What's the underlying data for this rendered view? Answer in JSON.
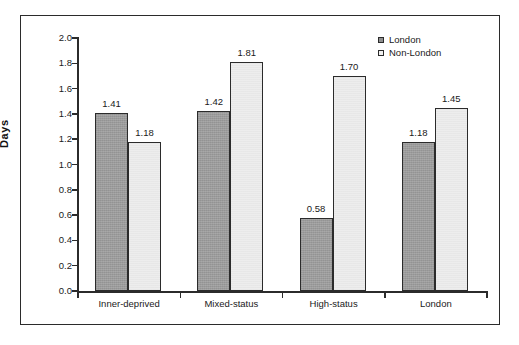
{
  "chart_data": {
    "type": "bar",
    "title": "",
    "xlabel": "",
    "ylabel": "Days",
    "ylim": [
      0.0,
      2.0
    ],
    "ytick_labels": [
      "2.0",
      "1.8",
      "1.6",
      "1.4",
      "1.2",
      "1.0",
      "0.8",
      "0.6",
      "0.4",
      "0.2",
      "0.0"
    ],
    "ytick_values": [
      2.0,
      1.8,
      1.6,
      1.4,
      1.2,
      1.0,
      0.8,
      0.6,
      0.4,
      0.2,
      0.0
    ],
    "grid": false,
    "legend_position": "top-right",
    "categories": [
      "Inner-deprived",
      "Mixed-status",
      "High-status",
      "London"
    ],
    "series": [
      {
        "name": "London",
        "color": "#9b9b9b",
        "values": [
          1.41,
          1.42,
          0.58,
          1.18
        ],
        "labels": [
          "1.41",
          "1.42",
          "0.58",
          "1.18"
        ]
      },
      {
        "name": "Non-London",
        "color": "#ededed",
        "values": [
          1.18,
          1.81,
          1.7,
          1.45
        ],
        "labels": [
          "1.18",
          "1.81",
          "1.70",
          "1.45"
        ]
      }
    ]
  },
  "legend": {
    "items": [
      {
        "label": "London",
        "swatch": "london-swatch-icon"
      },
      {
        "label": "Non-London",
        "swatch": "non-london-swatch-icon"
      }
    ]
  },
  "axis": {
    "y_title": "Days"
  },
  "colors": {
    "axis": "#2b2b2b",
    "frame": "#2b2b2b",
    "london_bar": "#9b9b9b",
    "non_london_bar": "#ededed",
    "text": "#1a1a1a",
    "background": "#ffffff"
  }
}
